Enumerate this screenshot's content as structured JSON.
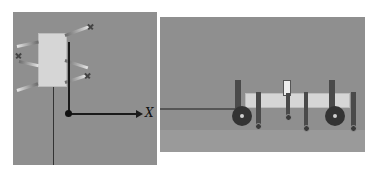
{
  "figure": {
    "left_panel": {
      "view": "top-view",
      "axis_label": "X",
      "colors": {
        "background": "#8f8f8f",
        "body": "#d6d6d6",
        "axis": "#1a1a1a"
      }
    },
    "right_panel": {
      "view": "side-view",
      "colors": {
        "background": "#8f8f8f",
        "ground": "#9a9a9a",
        "body": "#d6d6d6",
        "wheel": "#333333"
      }
    }
  }
}
